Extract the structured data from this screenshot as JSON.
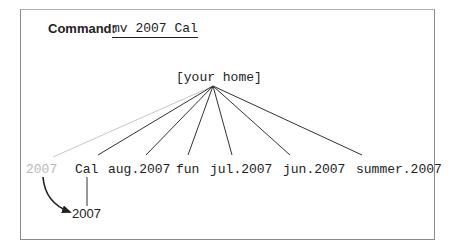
{
  "command": {
    "label": "Command:",
    "code": "mv 2007 Cal"
  },
  "tree": {
    "root": "[your home]",
    "children": [
      {
        "label": "2007",
        "state": "moved-source",
        "color": "#b8b8b8"
      },
      {
        "label": "Cal",
        "state": "normal"
      },
      {
        "label": "aug.2007",
        "state": "normal"
      },
      {
        "label": "fun",
        "state": "normal"
      },
      {
        "label": "jul.2007",
        "state": "normal"
      },
      {
        "label": "jun.2007",
        "state": "normal"
      },
      {
        "label": "summer.2007",
        "state": "normal"
      }
    ],
    "moved_item": {
      "label": "2007",
      "parent": "Cal"
    }
  },
  "colors": {
    "line": "#333333",
    "faded_line": "#c8c8c8",
    "frame": "#8a8a8a"
  }
}
